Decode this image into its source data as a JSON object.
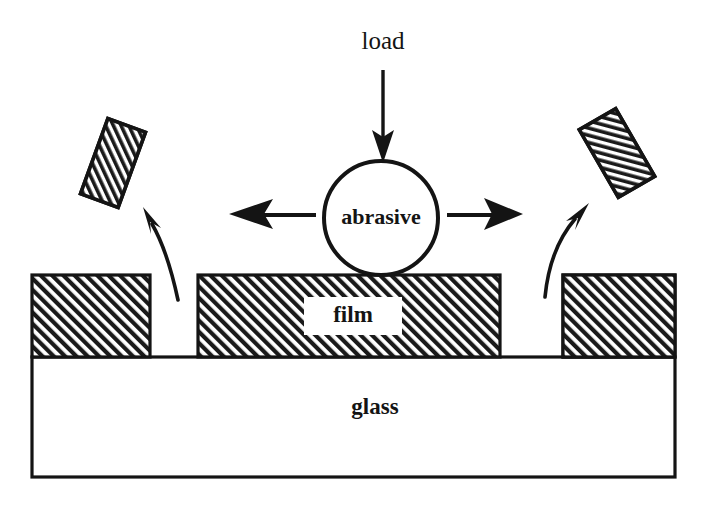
{
  "figure": {
    "background_color": "#ffffff",
    "ink_color": "#141414",
    "width": 709,
    "height": 508
  },
  "labels": {
    "load": "load",
    "abrasive": "abrasive",
    "film": "film",
    "glass": "glass"
  },
  "diagram_data": {
    "type": "schematic",
    "description": "Cross-section schematic: a downward load presses a round abrasive particle onto a hatched thin film deposited on a glass substrate; the particle pushes film material sideways, detaching hatched film fragments that fly away along curved paths on both sides.",
    "layers": [
      {
        "name": "glass",
        "role": "substrate",
        "fill": "white",
        "stroke": "#141414",
        "label": "glass"
      },
      {
        "name": "film",
        "role": "coating",
        "fill": "diagonal-hatch",
        "stroke": "#141414",
        "label": "film"
      }
    ],
    "elements": [
      {
        "name": "load-arrow",
        "kind": "straight-arrow",
        "direction": "down",
        "label": "load"
      },
      {
        "name": "abrasive-particle",
        "kind": "circle",
        "label": "abrasive"
      },
      {
        "name": "left-push-arrow",
        "kind": "straight-arrow",
        "direction": "left"
      },
      {
        "name": "right-push-arrow",
        "kind": "straight-arrow",
        "direction": "right"
      },
      {
        "name": "left-debris-path",
        "kind": "curved-arrow",
        "direction": "up-left"
      },
      {
        "name": "right-debris-path",
        "kind": "curved-arrow",
        "direction": "up-right"
      },
      {
        "name": "left-film-fragment",
        "kind": "hatched-rectangle",
        "rotation_deg": 20
      },
      {
        "name": "right-film-fragment",
        "kind": "hatched-rectangle",
        "rotation_deg": -30
      }
    ],
    "film_segments": [
      {
        "name": "left-film-segment",
        "x_start": 32,
        "x_end": 150
      },
      {
        "name": "center-film-segment",
        "x_start": 198,
        "x_end": 500
      },
      {
        "name": "right-film-segment",
        "x_start": 563,
        "x_end": 675
      }
    ],
    "geometry": {
      "film_top_y": 275,
      "film_bottom_y": 357,
      "glass_top_y": 357,
      "glass_bottom_y": 477,
      "glass_x_start": 32,
      "glass_x_end": 675,
      "abrasive_center": [
        381,
        218
      ],
      "abrasive_radius": 57
    }
  }
}
